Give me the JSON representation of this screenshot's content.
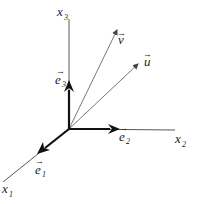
{
  "diagram": {
    "type": "3d-coordinate-system",
    "axes": [
      {
        "id": "x1",
        "label": "x",
        "subscript": "1"
      },
      {
        "id": "x2",
        "label": "x",
        "subscript": "2"
      },
      {
        "id": "x3",
        "label": "x",
        "subscript": "3"
      }
    ],
    "basis_vectors": [
      {
        "id": "e1",
        "label": "e",
        "subscript": "1",
        "arrow": "→"
      },
      {
        "id": "e2",
        "label": "e",
        "subscript": "2",
        "arrow": "→"
      },
      {
        "id": "e3",
        "label": "e",
        "subscript": "3",
        "arrow": "→"
      }
    ],
    "vectors": [
      {
        "id": "u",
        "label": "u",
        "arrow": "→"
      },
      {
        "id": "v",
        "label": "v",
        "arrow": "→"
      }
    ],
    "colors": {
      "line": "#333333",
      "thick": "#111111",
      "background": "#ffffff"
    }
  }
}
